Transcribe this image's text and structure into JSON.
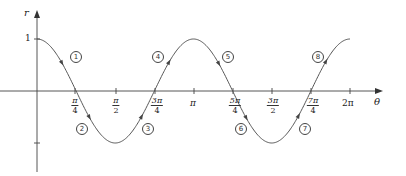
{
  "chart_data": {
    "type": "line",
    "title": "",
    "function": "r = cos 2θ",
    "xlabel": "θ",
    "ylabel": "r",
    "xlim": [
      0,
      6.2832
    ],
    "ylim": [
      -1,
      1
    ],
    "grid": false,
    "legend": null,
    "y_ticks": [
      {
        "value": 1,
        "label": "1"
      },
      {
        "value": -1,
        "label": ""
      }
    ],
    "x_ticks": [
      {
        "value": 0.7854,
        "num": "π",
        "den": "4"
      },
      {
        "value": 1.5708,
        "num": "π",
        "den": "2"
      },
      {
        "value": 2.3562,
        "num": "3π",
        "den": "4"
      },
      {
        "value": 3.1416,
        "label": "π"
      },
      {
        "value": 3.927,
        "num": "5π",
        "den": "4"
      },
      {
        "value": 4.7124,
        "num": "3π",
        "den": "2"
      },
      {
        "value": 5.4978,
        "num": "7π",
        "den": "4"
      },
      {
        "value": 6.2832,
        "label": "2π"
      }
    ],
    "x": [
      0,
      0.7854,
      1.5708,
      2.3562,
      3.1416,
      3.927,
      4.7124,
      5.4978,
      6.2832
    ],
    "series": [
      {
        "name": "cos 2θ",
        "values": [
          1,
          0,
          -1,
          0,
          1,
          0,
          -1,
          0,
          1
        ]
      }
    ],
    "annotations": [
      {
        "label": "1",
        "x": 0.55,
        "y": 0.62
      },
      {
        "label": "2",
        "x": 0.9,
        "y": -0.8
      },
      {
        "label": "3",
        "x": 2.2,
        "y": -0.8
      },
      {
        "label": "4",
        "x": 2.55,
        "y": 0.62
      },
      {
        "label": "5",
        "x": 3.7,
        "y": 0.62
      },
      {
        "label": "6",
        "x": 4.05,
        "y": -0.8
      },
      {
        "label": "7",
        "x": 5.35,
        "y": -0.8
      },
      {
        "label": "8",
        "x": 5.7,
        "y": 0.62
      }
    ]
  },
  "axes": {
    "y_label": "r",
    "x_label": "θ",
    "y_one": "1",
    "x_labels": {
      "pi4_num": "π",
      "pi4_den": "4",
      "pi2_num": "π",
      "pi2_den": "2",
      "3pi4_num": "3π",
      "3pi4_den": "4",
      "pi": "π",
      "5pi4_num": "5π",
      "5pi4_den": "4",
      "3pi2_num": "3π",
      "3pi2_den": "2",
      "7pi4_num": "7π",
      "7pi4_den": "4",
      "2pi": "2π"
    }
  },
  "segments": [
    "1",
    "2",
    "3",
    "4",
    "5",
    "6",
    "7",
    "8"
  ]
}
